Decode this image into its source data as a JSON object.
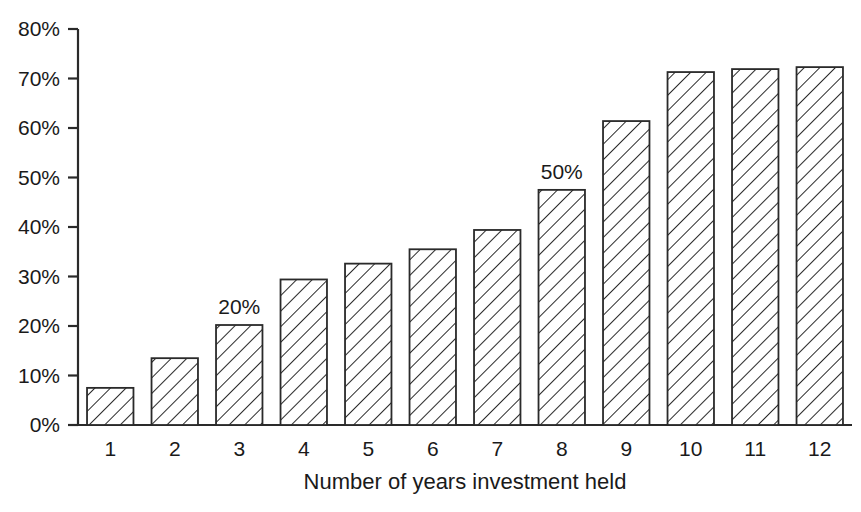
{
  "chart_data": {
    "type": "bar",
    "title": "",
    "xlabel": "Number of years investment held",
    "ylabel": "",
    "categories": [
      "1",
      "2",
      "3",
      "4",
      "5",
      "6",
      "7",
      "8",
      "9",
      "10",
      "11",
      "12"
    ],
    "values": [
      7.5,
      13.5,
      20.2,
      29.4,
      32.6,
      35.5,
      39.4,
      47.5,
      61.4,
      71.3,
      71.9,
      72.3
    ],
    "ylim": [
      0,
      80
    ],
    "ytick_values": [
      0,
      10,
      20,
      30,
      40,
      50,
      60,
      70,
      80
    ],
    "ytick_labels": [
      "0%",
      "10%",
      "20%",
      "30%",
      "40%",
      "50%",
      "60%",
      "70%",
      "80%"
    ],
    "grid": false,
    "legend": false,
    "legend_position": "none",
    "bar_fill": "#ffffff",
    "bar_edge_color": "#2a2a2a",
    "bar_hatch": "diagonal-forward-slash",
    "axis_color": "#2a2a2a",
    "annotations": [
      {
        "category": "3",
        "label": "20%",
        "value": 20.2
      },
      {
        "category": "8",
        "label": "50%",
        "value": 47.5
      }
    ]
  }
}
